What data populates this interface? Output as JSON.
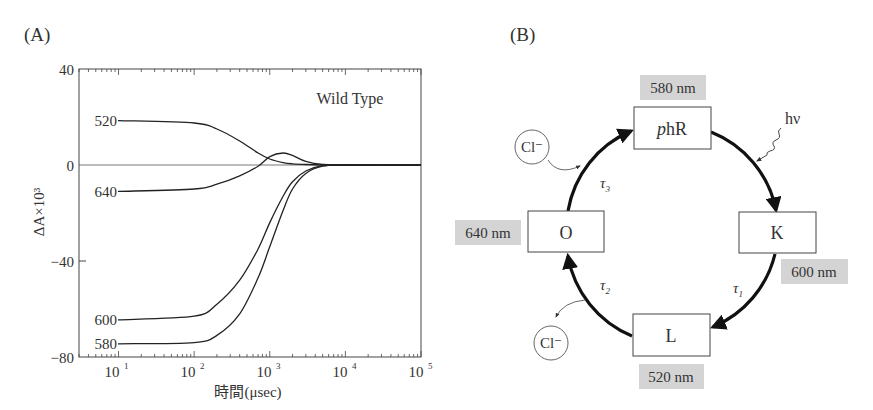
{
  "panels": {
    "a": {
      "label": "(A)"
    },
    "b": {
      "label": "(B)"
    }
  },
  "chart_data": {
    "type": "line",
    "title": "",
    "annotation": "Wild Type",
    "xlabel": "時間(μsec)",
    "ylabel": "ΔA×10³",
    "xscale": "log",
    "xlim": [
      3,
      100000
    ],
    "ylim": [
      -80,
      40
    ],
    "x_ticks": [
      {
        "value": 10,
        "label": "10",
        "exp": "1"
      },
      {
        "value": 100,
        "label": "10",
        "exp": "2"
      },
      {
        "value": 1000,
        "label": "10",
        "exp": "3"
      },
      {
        "value": 10000,
        "label": "10",
        "exp": "4"
      },
      {
        "value": 100000,
        "label": "10",
        "exp": "5"
      }
    ],
    "y_ticks": [
      {
        "value": 40,
        "label": "40"
      },
      {
        "value": 0,
        "label": "0"
      },
      {
        "value": -40,
        "label": "−40"
      },
      {
        "value": -80,
        "label": "−80"
      }
    ],
    "grid": false,
    "zero_line": true,
    "series": [
      {
        "name": "520",
        "label": "520",
        "x": [
          10,
          100,
          200,
          400,
          700,
          1000,
          1500,
          2000,
          3000,
          5000,
          10000,
          100000
        ],
        "y": [
          18.5,
          17.5,
          15.0,
          10.0,
          5.0,
          2.5,
          1.0,
          0.5,
          0.2,
          0,
          0,
          0
        ]
      },
      {
        "name": "640",
        "label": "640",
        "x": [
          10,
          100,
          200,
          400,
          700,
          1000,
          1500,
          2000,
          3000,
          5000,
          10000,
          100000
        ],
        "y": [
          -11.0,
          -10.0,
          -8.0,
          -4.5,
          -0.5,
          3.5,
          5.0,
          4.0,
          1.5,
          0.2,
          0,
          0
        ]
      },
      {
        "name": "600",
        "label": "600",
        "x": [
          10,
          100,
          200,
          400,
          700,
          1000,
          1500,
          2000,
          3000,
          5000,
          10000,
          100000
        ],
        "y": [
          -64.5,
          -63.0,
          -58.0,
          -48.0,
          -35.0,
          -24.0,
          -13.0,
          -7.0,
          -2.5,
          -0.3,
          0,
          0
        ]
      },
      {
        "name": "580",
        "label": "580",
        "x": [
          10,
          100,
          200,
          400,
          700,
          1000,
          1500,
          2000,
          3000,
          5000,
          10000,
          100000
        ],
        "y": [
          -74.5,
          -74.0,
          -71.0,
          -62.0,
          -47.0,
          -34.0,
          -19.0,
          -10.0,
          -3.5,
          -0.5,
          0,
          0
        ]
      }
    ]
  },
  "diagram": {
    "states": [
      {
        "id": "phR",
        "label_italic": "p",
        "label": "hR",
        "wavelength": "580 nm"
      },
      {
        "id": "K",
        "label": "K",
        "wavelength": "600 nm"
      },
      {
        "id": "L",
        "label": "L",
        "wavelength": "520 nm"
      },
      {
        "id": "O",
        "label": "O",
        "wavelength": "640 nm"
      }
    ],
    "transitions": [
      {
        "from": "phR",
        "to": "K",
        "label": "",
        "trigger": "hν"
      },
      {
        "from": "K",
        "to": "L",
        "label": "τ",
        "sub": "1"
      },
      {
        "from": "L",
        "to": "O",
        "label": "τ",
        "sub": "2",
        "release": "Cl⁻"
      },
      {
        "from": "O",
        "to": "phR",
        "label": "τ",
        "sub": "3",
        "uptake": "Cl⁻"
      }
    ],
    "light_label": "hν",
    "ion_top": "Cl⁻",
    "ion_bottom": "Cl⁻"
  }
}
